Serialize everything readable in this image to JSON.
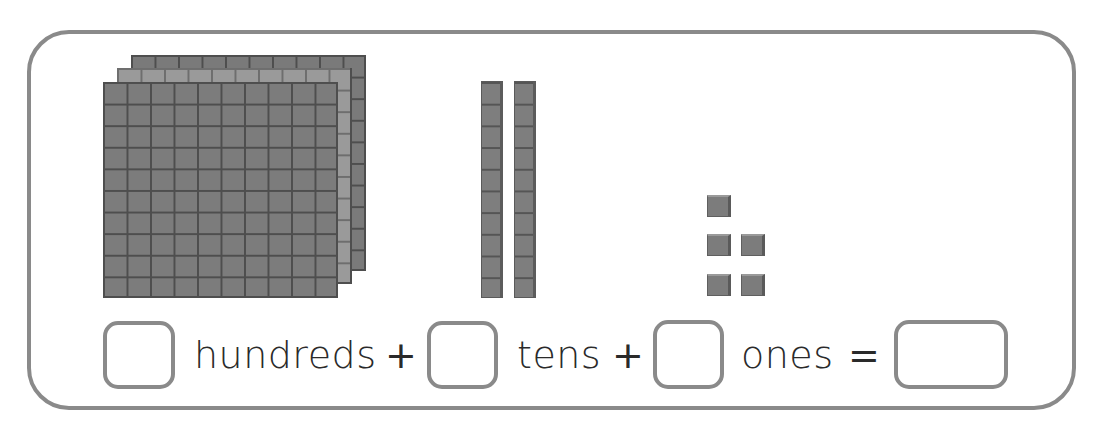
{
  "worksheet": {
    "blocks": {
      "hundreds_count": 3,
      "tens_count": 2,
      "ones_count": 5
    },
    "equation": {
      "hundreds_label": "hundreds",
      "tens_label": "tens",
      "ones_label": "ones",
      "plus_1": "+",
      "plus_2": "+",
      "equals": "=",
      "hundreds_answer": "",
      "tens_answer": "",
      "ones_answer": "",
      "total_answer": ""
    },
    "colors": {
      "frame_border": "#8a8a8a",
      "block_fill": "#7c7c7c",
      "block_grid": "#4e4e4e",
      "text": "#2a2a2a"
    }
  }
}
